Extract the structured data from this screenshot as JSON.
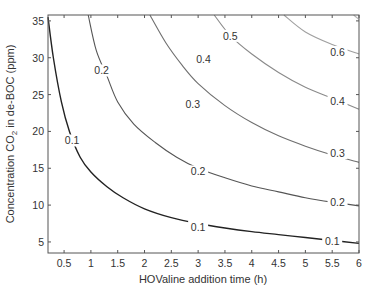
{
  "chart_data": {
    "type": "contour",
    "title": "",
    "xlabel": "HOValine addition time (h)",
    "ylabel_main": "Concentration CO",
    "ylabel_sub": "2",
    "ylabel_tail": " in de-BOC (ppm)",
    "ylabel": "Concentration CO2 in de-BOC (ppm)",
    "xlim": [
      0.2,
      6
    ],
    "ylim": [
      3.5,
      35.8
    ],
    "xticks": [
      0.5,
      1,
      1.5,
      2,
      2.5,
      3,
      3.5,
      4,
      4.5,
      5,
      5.5,
      6
    ],
    "xtick_labels": [
      "0.5",
      "1",
      "1.5",
      "2",
      "2.5",
      "3",
      "3.5",
      "4",
      "4.5",
      "5",
      "5.5",
      "6"
    ],
    "yticks": [
      5,
      10,
      15,
      20,
      25,
      30,
      35
    ],
    "ytick_labels": [
      "5",
      "10",
      "15",
      "20",
      "25",
      "30",
      "35"
    ],
    "grid": false,
    "legend": "none",
    "levels": [
      {
        "value": 0.1,
        "label": "0.1",
        "color": "#222222",
        "points": [
          [
            0.2,
            35.5
          ],
          [
            0.3,
            30
          ],
          [
            0.45,
            24
          ],
          [
            0.6,
            20
          ],
          [
            0.8,
            16.5
          ],
          [
            1.0,
            14.5
          ],
          [
            1.3,
            12.5
          ],
          [
            1.6,
            11
          ],
          [
            2.0,
            9.5
          ],
          [
            2.5,
            8.3
          ],
          [
            3.0,
            7.5
          ],
          [
            3.5,
            6.9
          ],
          [
            4.0,
            6.4
          ],
          [
            4.5,
            6.0
          ],
          [
            5.0,
            5.6
          ],
          [
            5.5,
            5.2
          ],
          [
            6.0,
            4.8
          ]
        ],
        "label_positions": [
          [
            0.65,
            18.5
          ],
          [
            3.0,
            6.8
          ],
          [
            5.5,
            4.9
          ]
        ]
      },
      {
        "value": 0.2,
        "label": "0.2",
        "color": "#555555",
        "points": [
          [
            0.95,
            35.8
          ],
          [
            1.1,
            31
          ],
          [
            1.3,
            27.5
          ],
          [
            1.5,
            24
          ],
          [
            1.8,
            21
          ],
          [
            2.2,
            18.5
          ],
          [
            2.6,
            16.5
          ],
          [
            3.0,
            15
          ],
          [
            3.5,
            13.7
          ],
          [
            4.0,
            12.6
          ],
          [
            4.5,
            11.8
          ],
          [
            5.0,
            11.0
          ],
          [
            5.5,
            10.4
          ],
          [
            6.0,
            9.9
          ]
        ],
        "label_positions": [
          [
            1.2,
            28
          ],
          [
            3.0,
            14.3
          ],
          [
            5.6,
            10.2
          ]
        ]
      },
      {
        "value": 0.3,
        "label": "0.3",
        "color": "#6f6f6f",
        "points": [
          [
            2.1,
            35.8
          ],
          [
            2.4,
            32
          ],
          [
            2.7,
            29
          ],
          [
            3.0,
            26.5
          ],
          [
            3.5,
            23.5
          ],
          [
            4.0,
            21.2
          ],
          [
            4.5,
            19.4
          ],
          [
            5.0,
            18.0
          ],
          [
            5.5,
            16.8
          ],
          [
            6.0,
            15.8
          ]
        ],
        "label_positions": [
          [
            2.9,
            23.5
          ],
          [
            5.6,
            16.8
          ]
        ]
      },
      {
        "value": 0.4,
        "label": "0.4",
        "color": "#8a8a8a",
        "points": [
          [
            3.3,
            35.8
          ],
          [
            3.6,
            33
          ],
          [
            4.0,
            30.5
          ],
          [
            4.5,
            28
          ],
          [
            5.0,
            26
          ],
          [
            5.5,
            24.5
          ],
          [
            6.0,
            23
          ]
        ],
        "label_positions": [
          [
            3.1,
            29.5
          ],
          [
            5.6,
            23.8
          ]
        ]
      },
      {
        "value": 0.5,
        "label": "0.5",
        "color": "#a0a0a0",
        "points": [
          [
            4.6,
            35.8
          ],
          [
            5.0,
            33.5
          ],
          [
            5.5,
            31.8
          ],
          [
            6.0,
            30.5
          ]
        ],
        "label_positions": [
          [
            3.6,
            32.7
          ]
        ]
      },
      {
        "value": 0.6,
        "label": "0.6",
        "color": "#b4b4b4",
        "points": [
          [
            5.9,
            35.8
          ],
          [
            6.0,
            35.2
          ]
        ],
        "label_positions": [
          [
            5.6,
            30.5
          ]
        ]
      }
    ]
  }
}
